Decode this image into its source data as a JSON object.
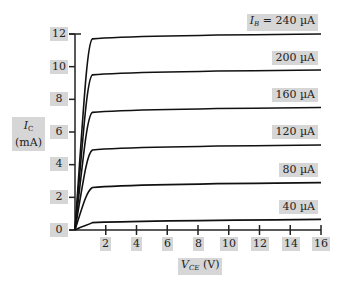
{
  "chart_data": {
    "type": "line",
    "title": "",
    "xlabel": "V_CE (V)",
    "ylabel": "I_C (mA)",
    "xlim": [
      0,
      16
    ],
    "ylim": [
      0,
      12
    ],
    "x_ticks": [
      2,
      4,
      6,
      8,
      10,
      12,
      14,
      16
    ],
    "y_ticks": [
      0,
      2,
      4,
      6,
      8,
      10,
      12
    ],
    "grid": false,
    "legend_position": "inline-right",
    "series": [
      {
        "name": "I_B = 240 µA",
        "label": "I_B = 240 µA",
        "x": [
          0,
          1,
          16
        ],
        "values": [
          0,
          11.7,
          12.0
        ]
      },
      {
        "name": "200 µA",
        "label": "200 µA",
        "x": [
          0,
          1,
          16
        ],
        "values": [
          0,
          9.5,
          9.8
        ]
      },
      {
        "name": "160 µA",
        "label": "160 µA",
        "x": [
          0,
          1,
          16
        ],
        "values": [
          0,
          7.2,
          7.5
        ]
      },
      {
        "name": "120 µA",
        "label": "120 µA",
        "x": [
          0,
          1,
          16
        ],
        "values": [
          0,
          4.9,
          5.2
        ]
      },
      {
        "name": "80 µA",
        "label": "80 µA",
        "x": [
          0,
          1,
          16
        ],
        "values": [
          0,
          2.6,
          2.9
        ]
      },
      {
        "name": "40 µA",
        "label": "40 µA",
        "x": [
          0,
          1,
          16
        ],
        "values": [
          0,
          0.45,
          0.65
        ]
      }
    ]
  },
  "labels": {
    "ylabel_line1": "I",
    "ylabel_sub": "C",
    "ylabel_line2": "(mA)",
    "xlabel_main": "V",
    "xlabel_sub": "CE",
    "xlabel_unit": " (V)",
    "first_series_prefix": "I",
    "first_series_sub": "B",
    "first_series_rest": " = 240 µA",
    "series_labels": [
      "200 µA",
      "160 µA",
      "120 µA",
      "80 µA",
      "40 µA"
    ],
    "y_tick_labels": [
      "12",
      "10",
      "8",
      "6",
      "4",
      "2",
      "0"
    ],
    "x_tick_labels": [
      "2",
      "4",
      "6",
      "8",
      "10",
      "12",
      "14",
      "16"
    ]
  }
}
